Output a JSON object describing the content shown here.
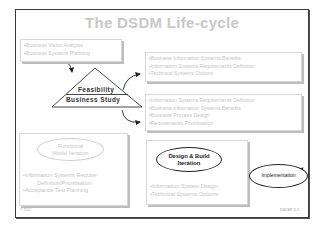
{
  "title": "The DSDM Life-cycle",
  "pre_project_box": {
    "items": [
      "Business Vision Analysis",
      "Business Systems Planning"
    ]
  },
  "feasibility": {
    "top_label": "Feasibility",
    "bottom_label": "Business Study"
  },
  "feasibility_outputs_box": {
    "items": [
      "Business Information Systems Benefits",
      "Information Systems Requirements Definition",
      "Technical Systems Options"
    ]
  },
  "business_study_outputs_box": {
    "items": [
      "Information Systems Requirements Definition",
      "Business Information Systems Benefits",
      "Business Process Design",
      "Requirements Prioritisation"
    ]
  },
  "functional_model": {
    "label_line1": "Functional",
    "label_line2": "Model Iteration",
    "items": [
      "Information Systems Require- Definition/Prioritisation",
      "Acceptance Test Planning"
    ],
    "item1_line1": "Information Systems Require-",
    "item1_line2": "Definition/Prioritisation",
    "item2": "Acceptance Test Planning"
  },
  "design_build": {
    "label_line1": "Design & Build",
    "label_line2": "Iteration",
    "items": [
      "Information System Design",
      "Technical Systems Options"
    ]
  },
  "implementation": {
    "label": "Implementation"
  },
  "footer": {
    "left": "© TCC",
    "right": "DSDMP-3-3"
  },
  "colors": {
    "frame": "#3a3a3a",
    "faded_text": "#c4c4c4",
    "dark_text": "#222222",
    "box_shadow": "#bdbdbd"
  }
}
